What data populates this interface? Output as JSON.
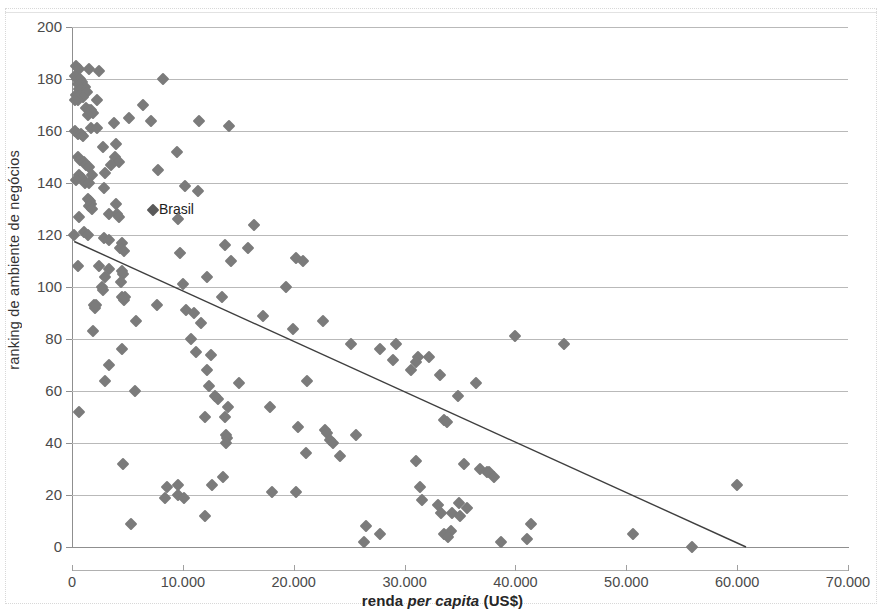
{
  "chart_data": {
    "type": "scatter",
    "title": "",
    "xlabel": "renda per capita (US$)",
    "xlabel_plain": "renda ",
    "xlabel_italic": "per capita",
    "xlabel_tail": " (US$)",
    "ylabel": "ranking de ambiente de negócios",
    "xlim": [
      0,
      70000
    ],
    "ylim": [
      0,
      200
    ],
    "xticks": [
      0,
      10000,
      20000,
      30000,
      40000,
      50000,
      60000,
      70000
    ],
    "xtick_labels": [
      "0",
      "10.000",
      "20.000",
      "30.000",
      "40.000",
      "50.000",
      "60.000",
      "70.000"
    ],
    "yticks": [
      0,
      20,
      40,
      60,
      80,
      100,
      120,
      140,
      160,
      180,
      200
    ],
    "ytick_labels": [
      "0",
      "20",
      "40",
      "60",
      "80",
      "100",
      "120",
      "140",
      "160",
      "180",
      "200"
    ],
    "grid": "horizontal",
    "legend": "none",
    "marker_shape": "diamond",
    "marker_color": "#7b7b7b",
    "trendline": {
      "type": "linear",
      "color": "#3f3f3f",
      "x_start": 200,
      "y_start": 117.5,
      "x_end": 60800,
      "y_end": 0
    },
    "annotations": [
      {
        "text": "Brasil",
        "x": 7300,
        "y": 129.5
      }
    ],
    "points": [
      [
        350,
        185
      ],
      [
        600,
        184
      ],
      [
        1500,
        184
      ],
      [
        2400,
        183
      ],
      [
        250,
        181
      ],
      [
        450,
        180
      ],
      [
        700,
        180
      ],
      [
        900,
        179
      ],
      [
        500,
        178
      ],
      [
        750,
        178
      ],
      [
        1000,
        177
      ],
      [
        1200,
        177
      ],
      [
        600,
        176
      ],
      [
        850,
        176
      ],
      [
        1100,
        175
      ],
      [
        1350,
        175
      ],
      [
        400,
        174
      ],
      [
        700,
        174
      ],
      [
        1000,
        173
      ],
      [
        8200,
        180
      ],
      [
        550,
        172
      ],
      [
        300,
        172
      ],
      [
        2300,
        172
      ],
      [
        6400,
        170
      ],
      [
        1300,
        169
      ],
      [
        1500,
        168
      ],
      [
        1700,
        168
      ],
      [
        1900,
        167
      ],
      [
        5100,
        165
      ],
      [
        1450,
        166
      ],
      [
        7100,
        164
      ],
      [
        11500,
        164
      ],
      [
        1700,
        161
      ],
      [
        2300,
        161
      ],
      [
        3800,
        163
      ],
      [
        14200,
        162
      ],
      [
        250,
        160
      ],
      [
        500,
        159
      ],
      [
        800,
        159
      ],
      [
        1000,
        158
      ],
      [
        2800,
        154
      ],
      [
        4000,
        155
      ],
      [
        9500,
        152
      ],
      [
        3900,
        150
      ],
      [
        500,
        150
      ],
      [
        700,
        149
      ],
      [
        1100,
        148
      ],
      [
        4200,
        148
      ],
      [
        1300,
        147
      ],
      [
        1500,
        146
      ],
      [
        3500,
        147
      ],
      [
        7800,
        145
      ],
      [
        600,
        143
      ],
      [
        900,
        142
      ],
      [
        1800,
        143
      ],
      [
        3000,
        144
      ],
      [
        400,
        141
      ],
      [
        1200,
        140
      ],
      [
        1500,
        140
      ],
      [
        10200,
        139
      ],
      [
        2900,
        138
      ],
      [
        11400,
        137
      ],
      [
        4000,
        132
      ],
      [
        1400,
        134
      ],
      [
        1600,
        133
      ],
      [
        1700,
        132
      ],
      [
        1500,
        131
      ],
      [
        1800,
        130
      ],
      [
        4100,
        128
      ],
      [
        4200,
        127
      ],
      [
        3300,
        128
      ],
      [
        9600,
        126
      ],
      [
        600,
        127
      ],
      [
        16400,
        124
      ],
      [
        1100,
        121
      ],
      [
        1400,
        120
      ],
      [
        2900,
        119
      ],
      [
        3300,
        118
      ],
      [
        4500,
        117
      ],
      [
        13800,
        116
      ],
      [
        200,
        120
      ],
      [
        4300,
        115
      ],
      [
        15900,
        115
      ],
      [
        20200,
        111
      ],
      [
        4700,
        114
      ],
      [
        9700,
        113
      ],
      [
        20800,
        110
      ],
      [
        14300,
        110
      ],
      [
        500,
        108
      ],
      [
        2400,
        108
      ],
      [
        3300,
        107
      ],
      [
        4500,
        106
      ],
      [
        4600,
        105
      ],
      [
        3000,
        104
      ],
      [
        12200,
        104
      ],
      [
        4400,
        102
      ],
      [
        2700,
        100
      ],
      [
        2800,
        99
      ],
      [
        10000,
        101
      ],
      [
        19300,
        100
      ],
      [
        4500,
        96
      ],
      [
        4700,
        95
      ],
      [
        4800,
        96
      ],
      [
        13500,
        96
      ],
      [
        2000,
        93
      ],
      [
        2100,
        92
      ],
      [
        2200,
        93
      ],
      [
        7700,
        93
      ],
      [
        10300,
        91
      ],
      [
        17200,
        89
      ],
      [
        22600,
        87
      ],
      [
        5800,
        87
      ],
      [
        11600,
        86
      ],
      [
        11000,
        90
      ],
      [
        19900,
        84
      ],
      [
        1900,
        83
      ],
      [
        10700,
        80
      ],
      [
        25200,
        78
      ],
      [
        29200,
        78
      ],
      [
        40000,
        81
      ],
      [
        44400,
        78
      ],
      [
        4500,
        76
      ],
      [
        11200,
        75
      ],
      [
        27800,
        76
      ],
      [
        12500,
        74
      ],
      [
        31200,
        73
      ],
      [
        32200,
        73
      ],
      [
        3300,
        70
      ],
      [
        12200,
        68
      ],
      [
        29000,
        72
      ],
      [
        31000,
        71
      ],
      [
        30600,
        68
      ],
      [
        3000,
        64
      ],
      [
        12400,
        62
      ],
      [
        33200,
        66
      ],
      [
        21200,
        64
      ],
      [
        5700,
        60
      ],
      [
        15100,
        63
      ],
      [
        36400,
        63
      ],
      [
        34800,
        58
      ],
      [
        13200,
        57
      ],
      [
        12900,
        58
      ],
      [
        14100,
        54
      ],
      [
        17900,
        54
      ],
      [
        600,
        52
      ],
      [
        12000,
        50
      ],
      [
        13800,
        50
      ],
      [
        33600,
        49
      ],
      [
        33800,
        48
      ],
      [
        20400,
        46
      ],
      [
        22800,
        45
      ],
      [
        23000,
        44
      ],
      [
        13900,
        43
      ],
      [
        14000,
        42
      ],
      [
        25600,
        43
      ],
      [
        23300,
        41
      ],
      [
        23500,
        40
      ],
      [
        13900,
        40
      ],
      [
        31000,
        33
      ],
      [
        4600,
        32
      ],
      [
        35400,
        32
      ],
      [
        21100,
        36
      ],
      [
        24200,
        35
      ],
      [
        36800,
        30
      ],
      [
        37400,
        29
      ],
      [
        37600,
        29
      ],
      [
        38100,
        27
      ],
      [
        9600,
        24
      ],
      [
        12600,
        24
      ],
      [
        13600,
        27
      ],
      [
        8600,
        23
      ],
      [
        18000,
        21
      ],
      [
        9600,
        20
      ],
      [
        20200,
        21
      ],
      [
        8400,
        19
      ],
      [
        10100,
        19
      ],
      [
        31400,
        23
      ],
      [
        31600,
        18
      ],
      [
        34900,
        17
      ],
      [
        35600,
        15
      ],
      [
        33000,
        16
      ],
      [
        33300,
        13
      ],
      [
        34300,
        13
      ],
      [
        35000,
        12
      ],
      [
        60000,
        24
      ],
      [
        12000,
        12
      ],
      [
        5300,
        9
      ],
      [
        41400,
        9
      ],
      [
        26500,
        8
      ],
      [
        27800,
        5
      ],
      [
        33600,
        5
      ],
      [
        34200,
        6
      ],
      [
        33900,
        4
      ],
      [
        38700,
        2
      ],
      [
        41000,
        3
      ],
      [
        26300,
        2
      ],
      [
        50600,
        5
      ],
      [
        55900,
        0
      ]
    ]
  }
}
